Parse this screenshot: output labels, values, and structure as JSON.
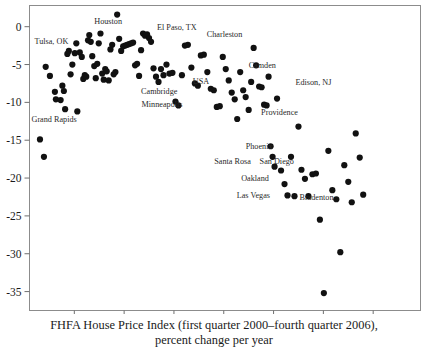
{
  "chart_data": {
    "type": "scatter",
    "title": "",
    "xlabel": "FHFA House Price Index (first quarter 2000–fourth quarter 2006), percent change per year",
    "ylabel": "",
    "xlim": [
      0.2,
      15.9
    ],
    "ylim": [
      -37.5,
      2.8
    ],
    "xticks": [
      2,
      4,
      6,
      8,
      10,
      12,
      14
    ],
    "yticks": [
      0,
      -5,
      -10,
      -15,
      -20,
      -25,
      -30,
      -35
    ],
    "xtick_labels": [
      "2",
      "4",
      "6",
      "8",
      "10",
      "12",
      "14"
    ],
    "ytick_labels": [
      "0",
      "-5",
      "-10",
      "-15",
      "-20",
      "-25",
      "-30",
      "-35"
    ],
    "grid": false,
    "legend": null,
    "marker": {
      "shape": "circle",
      "color": "#111111",
      "size": 3.1
    },
    "points": [
      [
        0.62,
        -14.9
      ],
      [
        0.78,
        -17.2
      ],
      [
        0.85,
        -5.3
      ],
      [
        1.02,
        -6.5
      ],
      [
        1.22,
        -8.6
      ],
      [
        1.26,
        -9.6
      ],
      [
        1.45,
        -9.7
      ],
      [
        1.52,
        -7.8
      ],
      [
        1.58,
        -8.5
      ],
      [
        1.63,
        -10.9
      ],
      [
        1.72,
        -3.6
      ],
      [
        1.78,
        -3.2
      ],
      [
        1.85,
        -6.3
      ],
      [
        1.92,
        -5.0
      ],
      [
        2.02,
        -3.5
      ],
      [
        2.08,
        -2.2
      ],
      [
        2.12,
        -11.2
      ],
      [
        2.22,
        -3.4
      ],
      [
        2.3,
        -4.0
      ],
      [
        2.36,
        -6.9
      ],
      [
        2.42,
        -6.4
      ],
      [
        2.48,
        -6.6
      ],
      [
        2.55,
        -1.8
      ],
      [
        2.6,
        -1.1
      ],
      [
        2.66,
        -2.0
      ],
      [
        2.72,
        -3.9
      ],
      [
        2.8,
        -5.2
      ],
      [
        2.86,
        -6.8
      ],
      [
        2.92,
        -4.9
      ],
      [
        2.98,
        -2.2
      ],
      [
        3.05,
        -0.9
      ],
      [
        3.12,
        -6.2
      ],
      [
        3.18,
        -7.0
      ],
      [
        3.24,
        -5.6
      ],
      [
        3.3,
        -5.9
      ],
      [
        3.38,
        -7.1
      ],
      [
        3.45,
        -3.0
      ],
      [
        3.52,
        -2.4
      ],
      [
        3.58,
        -6.3
      ],
      [
        3.65,
        -6.0
      ],
      [
        3.72,
        1.6
      ],
      [
        3.8,
        -1.6
      ],
      [
        3.88,
        -3.2
      ],
      [
        3.96,
        -2.6
      ],
      [
        4.04,
        -2.5
      ],
      [
        4.12,
        -2.4
      ],
      [
        4.2,
        -2.3
      ],
      [
        4.28,
        -2.2
      ],
      [
        4.36,
        -2.1
      ],
      [
        4.44,
        -5.1
      ],
      [
        4.52,
        -4.9
      ],
      [
        4.6,
        -6.5
      ],
      [
        4.68,
        -3.1
      ],
      [
        4.76,
        -0.9
      ],
      [
        4.84,
        -1.2
      ],
      [
        4.92,
        -1.0
      ],
      [
        5.0,
        -1.5
      ],
      [
        5.08,
        -2.0
      ],
      [
        5.18,
        -5.5
      ],
      [
        5.28,
        -6.6
      ],
      [
        5.38,
        -7.3
      ],
      [
        5.48,
        -5.6
      ],
      [
        5.58,
        -6.4
      ],
      [
        5.7,
        -5.0
      ],
      [
        5.82,
        -6.2
      ],
      [
        5.94,
        -6.1
      ],
      [
        6.06,
        -9.9
      ],
      [
        6.18,
        -10.4
      ],
      [
        6.32,
        -6.4
      ],
      [
        6.44,
        -2.5
      ],
      [
        6.56,
        -2.4
      ],
      [
        6.7,
        -5.4
      ],
      [
        6.84,
        -7.5
      ],
      [
        6.96,
        -7.8
      ],
      [
        7.08,
        -3.8
      ],
      [
        7.2,
        -3.7
      ],
      [
        7.34,
        -6.0
      ],
      [
        7.48,
        -8.2
      ],
      [
        7.6,
        -8.4
      ],
      [
        7.72,
        -10.6
      ],
      [
        7.84,
        -10.5
      ],
      [
        7.96,
        -4.0
      ],
      [
        8.08,
        -5.6
      ],
      [
        8.2,
        -7.1
      ],
      [
        8.32,
        -8.7
      ],
      [
        8.44,
        -9.6
      ],
      [
        8.54,
        -12.2
      ],
      [
        8.66,
        -6.0
      ],
      [
        8.78,
        -8.4
      ],
      [
        8.88,
        -9.3
      ],
      [
        9.0,
        -11.0
      ],
      [
        9.1,
        -7.3
      ],
      [
        9.2,
        -2.8
      ],
      [
        9.3,
        -5.1
      ],
      [
        9.42,
        -7.9
      ],
      [
        9.52,
        -8.0
      ],
      [
        9.62,
        -10.3
      ],
      [
        9.72,
        -10.4
      ],
      [
        9.8,
        -6.6
      ],
      [
        9.88,
        -15.8
      ],
      [
        9.96,
        -17.2
      ],
      [
        10.04,
        -18.5
      ],
      [
        10.14,
        -9.5
      ],
      [
        10.3,
        -19.0
      ],
      [
        10.44,
        -20.8
      ],
      [
        10.56,
        -22.3
      ],
      [
        10.7,
        -17.2
      ],
      [
        10.84,
        -22.4
      ],
      [
        11.0,
        -13.2
      ],
      [
        11.12,
        -18.9
      ],
      [
        11.26,
        -20.1
      ],
      [
        11.4,
        -22.4
      ],
      [
        11.56,
        -19.5
      ],
      [
        11.7,
        -19.4
      ],
      [
        11.86,
        -25.5
      ],
      [
        12.02,
        -35.2
      ],
      [
        12.2,
        -16.4
      ],
      [
        12.36,
        -21.6
      ],
      [
        12.52,
        -22.8
      ],
      [
        12.68,
        -29.8
      ],
      [
        12.84,
        -18.3
      ],
      [
        13.0,
        -20.5
      ],
      [
        13.14,
        -23.2
      ],
      [
        13.3,
        -14.1
      ],
      [
        13.46,
        -17.3
      ],
      [
        13.6,
        -22.2
      ]
    ],
    "annotations": [
      {
        "text": "Houston",
        "x": 2.8,
        "y": 0.4
      },
      {
        "text": "Tulsa, OK",
        "x": 0.4,
        "y": -2.3
      },
      {
        "text": "El Paso, TX",
        "x": 5.32,
        "y": -0.4
      },
      {
        "text": "Charleston",
        "x": 7.32,
        "y": -1.3
      },
      {
        "text": "Camden",
        "x": 9.0,
        "y": -5.4
      },
      {
        "text": "Edison, NJ",
        "x": 10.88,
        "y": -7.7
      },
      {
        "text": "Cambridge",
        "x": 4.68,
        "y": -8.9
      },
      {
        "text": "USA",
        "x": 6.76,
        "y": -7.6
      },
      {
        "text": "Minneapolis",
        "x": 4.7,
        "y": -10.6
      },
      {
        "text": "Grand Rapids",
        "x": 0.28,
        "y": -12.6
      },
      {
        "text": "Providence",
        "x": 9.5,
        "y": -11.7
      },
      {
        "text": "Phoenix",
        "x": 8.88,
        "y": -16.2
      },
      {
        "text": "Santa Rosa",
        "x": 7.62,
        "y": -18.1
      },
      {
        "text": "San Diego",
        "x": 9.44,
        "y": -18.2
      },
      {
        "text": "Oakland",
        "x": 8.7,
        "y": -20.4
      },
      {
        "text": "Las Vegas",
        "x": 8.52,
        "y": -22.7
      },
      {
        "text": "Bradenton",
        "x": 11.04,
        "y": -22.9
      }
    ]
  },
  "caption": {
    "line1": "FHFA House Price Index (first quarter 2000–fourth quarter 2006),",
    "line2": "percent change per year"
  }
}
